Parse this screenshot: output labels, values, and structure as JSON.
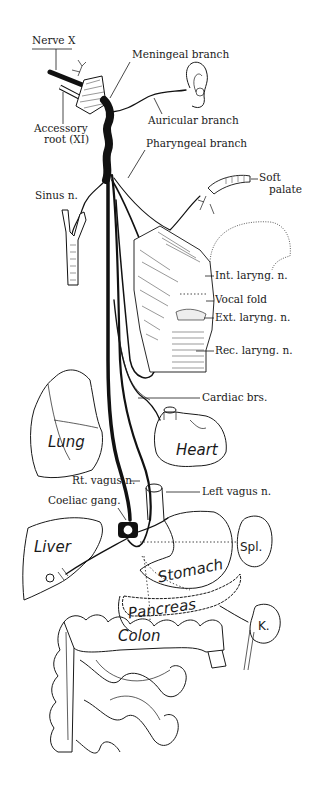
{
  "figure": {
    "labels": {
      "nerve_x": "Nerve X",
      "accessory_root_line1": "Accessory",
      "accessory_root_line2": "root (XI)",
      "meningeal_branch": "Meningeal branch",
      "auricular_branch": "Auricular branch",
      "pharyngeal_branch": "Pharyngeal branch",
      "soft_palate_line1": "Soft",
      "soft_palate_line2": "palate",
      "sinus_n": "Sinus n.",
      "int_laryng_n": "Int. laryng. n.",
      "vocal_fold": "Vocal fold",
      "ext_laryng_n": "Ext. laryng. n.",
      "rec_laryng_n": "Rec. laryng. n.",
      "cardiac_brs": "Cardiac brs.",
      "rt_vagus_n": "Rt. vagus n.",
      "left_vagus_n": "Left vagus n.",
      "coeliac_gang": "Coeliac gang."
    },
    "organs": {
      "lung": "Lung",
      "heart": "Heart",
      "liver": "Liver",
      "stomach": "Stomach",
      "spleen": "Spl.",
      "pancreas": "Pancreas",
      "kidney": "K.",
      "colon": "Colon"
    }
  }
}
